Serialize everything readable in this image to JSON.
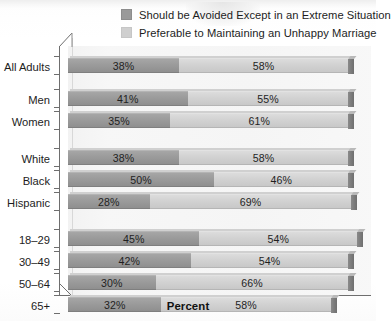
{
  "chart_data": {
    "type": "bar",
    "orientation": "horizontal",
    "stacked": true,
    "title": "",
    "xlabel": "Percent",
    "ylabel": "",
    "xlim": [
      0,
      100
    ],
    "grid": false,
    "legend_position": "top",
    "categories": [
      "All Adults",
      "Men",
      "Women",
      "White",
      "Black",
      "Hispanic",
      "18–29",
      "30–49",
      "50–64",
      "65+"
    ],
    "series": [
      {
        "name": "Should be Avoided Except in an Extreme Situation",
        "color": "#9a9a9a",
        "values": [
          38,
          41,
          35,
          38,
          50,
          28,
          45,
          42,
          30,
          32
        ],
        "labels": [
          "38%",
          "41%",
          "35%",
          "38%",
          "50%",
          "28%",
          "45%",
          "42%",
          "30%",
          "32%"
        ]
      },
      {
        "name": "Preferable to Maintaining an Unhappy Marriage",
        "color": "#cfcfcf",
        "values": [
          58,
          55,
          61,
          58,
          46,
          69,
          54,
          54,
          66,
          58
        ],
        "labels": [
          "58%",
          "55%",
          "61%",
          "58%",
          "46%",
          "69%",
          "54%",
          "54%",
          "66%",
          "58%"
        ]
      }
    ],
    "groups": [
      {
        "name": "overall",
        "categories": [
          "All Adults"
        ]
      },
      {
        "name": "gender",
        "categories": [
          "Men",
          "Women"
        ]
      },
      {
        "name": "race",
        "categories": [
          "White",
          "Black",
          "Hispanic"
        ]
      },
      {
        "name": "age",
        "categories": [
          "18–29",
          "30–49",
          "50–64",
          "65+"
        ]
      }
    ]
  },
  "legend": {
    "items": [
      {
        "label": "Should be Avoided Except in an Extreme Situation",
        "swatch": "dark"
      },
      {
        "label": "Preferable to Maintaining an Unhappy Marriage",
        "swatch": "light"
      }
    ]
  },
  "axis": {
    "x_title": "Percent"
  },
  "rows": [
    {
      "label": "All Adults",
      "dark": "38%",
      "light": "58%",
      "dark_value": 38,
      "light_value": 58,
      "top": 12
    },
    {
      "label": "Men",
      "dark": "41%",
      "light": "55%",
      "dark_value": 41,
      "light_value": 55,
      "top": 45
    },
    {
      "label": "Women",
      "dark": "35%",
      "light": "61%",
      "dark_value": 35,
      "light_value": 61,
      "top": 67
    },
    {
      "label": "White",
      "dark": "38%",
      "light": "58%",
      "dark_value": 38,
      "light_value": 58,
      "top": 104
    },
    {
      "label": "Black",
      "dark": "50%",
      "light": "46%",
      "dark_value": 50,
      "light_value": 46,
      "top": 126
    },
    {
      "label": "Hispanic",
      "dark": "28%",
      "light": "69%",
      "dark_value": 28,
      "light_value": 69,
      "top": 148
    },
    {
      "label": "18–29",
      "dark": "45%",
      "light": "54%",
      "dark_value": 45,
      "light_value": 54,
      "top": 185
    },
    {
      "label": "30–49",
      "dark": "42%",
      "light": "54%",
      "dark_value": 42,
      "light_value": 54,
      "top": 207
    },
    {
      "label": "50–64",
      "dark": "30%",
      "light": "66%",
      "dark_value": 30,
      "light_value": 66,
      "top": 229
    },
    {
      "label": "65+",
      "dark": "32%",
      "light": "58%",
      "dark_value": 32,
      "light_value": 58,
      "top": 251
    }
  ]
}
